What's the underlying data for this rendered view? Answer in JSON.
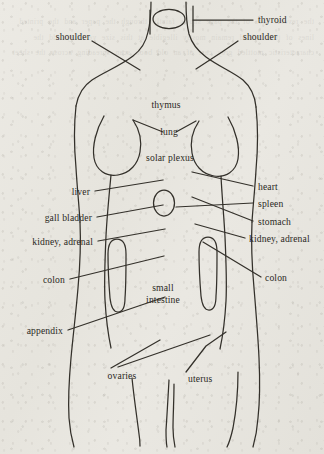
{
  "figure": {
    "style": {
      "paper_color": "#e7e5de",
      "ink_color": "#2b2924",
      "line_color": "#33302a"
    },
    "showthrough_text": "the reverse side of the page shows faintly through the paper and the printed lines of text behind remain mostly illegible at this size yet they add the characteristic mottled grey cast of an old book scan spreading across the sheet"
  },
  "labels": {
    "thyroid": "thyroid",
    "shoulder_left": "shoulder",
    "shoulder_right": "shoulder",
    "thymus": "thymus",
    "lung": "lung",
    "solar_plexus": "solar plexus",
    "liver": "liver",
    "gall_bladder": "gall bladder",
    "kidney_adrenal_left": "kidney, adrenal",
    "colon_left": "colon",
    "appendix": "appendix",
    "heart": "heart",
    "spleen": "spleen",
    "stomach": "stomach",
    "kidney_adrenal_right": "kidney, adrenal",
    "colon_right": "colon",
    "small_intestine_line1": "small",
    "small_intestine_line2": "intestine",
    "ovaries": "ovaries",
    "uterus": "uterus"
  }
}
